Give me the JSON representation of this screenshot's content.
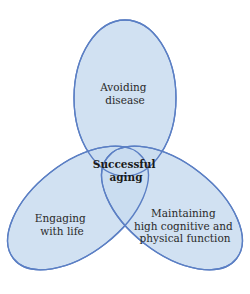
{
  "diagram": {
    "type": "venn",
    "colors": {
      "fill": "#c9dcf0",
      "stroke": "#5b7fc4",
      "text": "#2a2a2a"
    },
    "sets": [
      {
        "id": "top",
        "lines": [
          "Avoiding",
          "disease"
        ]
      },
      {
        "id": "left",
        "lines": [
          "Engaging",
          "with life"
        ]
      },
      {
        "id": "right",
        "lines": [
          "Maintaining",
          "high cognitive and",
          "physical function"
        ]
      }
    ],
    "center": {
      "lines": [
        "Successful",
        "aging"
      ]
    }
  }
}
